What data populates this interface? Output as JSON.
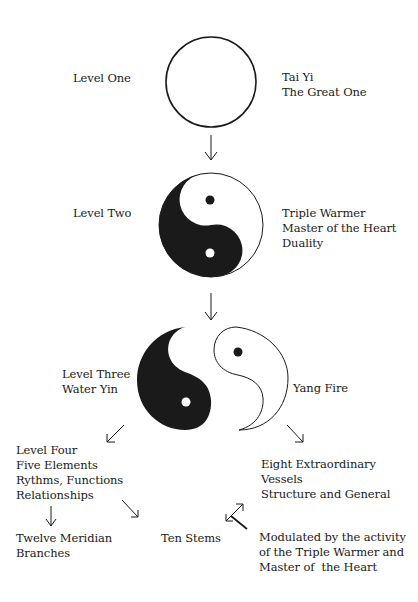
{
  "diagram": {
    "colors": {
      "ink": "#1a1a1a",
      "background": "#ffffff"
    },
    "level_one": {
      "label": "Level One",
      "symbol": "empty-circle",
      "description": [
        "Tai Yi",
        "The Great One"
      ]
    },
    "level_two": {
      "label": "Level Two",
      "symbol": "yin-yang",
      "description": [
        "Triple Warmer",
        "Master of the Heart",
        "Duality"
      ]
    },
    "level_three": {
      "label": [
        "Level Three",
        "Water Yin"
      ],
      "symbol": "separated-yin-yang",
      "right_label": "Yang Fire"
    },
    "level_four": {
      "lines": [
        "Level Four",
        "Five Elements",
        "Rythms, Functions",
        "Relationships"
      ]
    },
    "eight_extraordinary": {
      "lines": [
        "Eight Extraordinary",
        "Vessels",
        "Structure and General"
      ]
    },
    "twelve_meridian": {
      "lines": [
        "Twelve Meridian",
        "Branches"
      ]
    },
    "ten_stems": {
      "label": "Ten Stems"
    },
    "modulated": {
      "lines": [
        "Modulated by the activity",
        "of the Triple Warmer and",
        "Master of  the Heart"
      ]
    },
    "arrows": [
      {
        "from": "level-one",
        "to": "level-two",
        "direction": "down"
      },
      {
        "from": "level-two",
        "to": "level-three",
        "direction": "down"
      },
      {
        "from": "level-three",
        "to": "level-four",
        "direction": "down-left"
      },
      {
        "from": "level-three",
        "to": "eight-extraordinary",
        "direction": "down-right"
      },
      {
        "from": "level-four",
        "to": "twelve-meridian",
        "direction": "down"
      },
      {
        "from": "level-four",
        "to": "ten-stems",
        "direction": "down-right"
      },
      {
        "from": "ten-stems",
        "to": "eight-extraordinary",
        "direction": "bidirectional-diagonal"
      }
    ]
  }
}
